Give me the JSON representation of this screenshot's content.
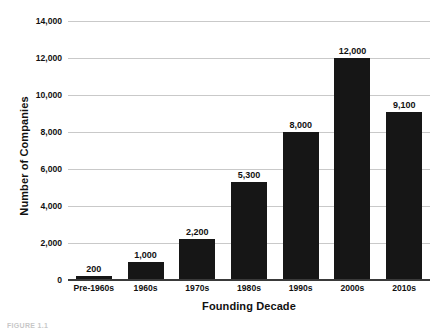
{
  "chart_data": {
    "type": "bar",
    "title": "",
    "xlabel": "Founding Decade",
    "ylabel": "Number of Companies",
    "categories": [
      "Pre-1960s",
      "1960s",
      "1970s",
      "1980s",
      "1990s",
      "2000s",
      "2010s"
    ],
    "values": [
      200,
      1000,
      2200,
      5300,
      8000,
      12000,
      9100
    ],
    "value_labels": [
      "200",
      "1,000",
      "2,200",
      "5,300",
      "8,000",
      "12,000",
      "9,100"
    ],
    "ylim": [
      0,
      14000
    ],
    "ytick_values": [
      0,
      2000,
      4000,
      6000,
      8000,
      10000,
      12000,
      14000
    ],
    "ytick_labels": [
      "0",
      "2,000",
      "4,000",
      "6,000",
      "8,000",
      "10,000",
      "12,000",
      "14,000"
    ],
    "grid": true,
    "legend": "none",
    "bar_color": "#161616",
    "grid_color": "#c9c9c9",
    "axis_color": "#3a3a3a",
    "text_color": "#111111"
  },
  "caption": {
    "text": "FIGURE 1.1"
  }
}
